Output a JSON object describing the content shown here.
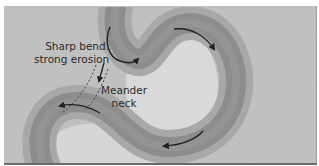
{
  "diagram": {
    "labels": {
      "sharp_bend": {
        "line1": "Sharp bend:",
        "line2": "strong erosion"
      },
      "meander_neck": {
        "line1": "Meander",
        "line2": "neck"
      }
    },
    "elements": {
      "river_channel": "S-shaped meandering river channel",
      "flow_arrows": "arrows showing downstream flow direction along the channel",
      "neck_lines": "dashed lines marking the narrow meander neck"
    },
    "colors": {
      "background": "#c6c6c6",
      "channel": "#8a8a8a",
      "channel_edge": "#a6a6a6",
      "inner_bank": "#dcdcdc",
      "arrow": "#222222",
      "text": "#2a2a2a"
    }
  }
}
